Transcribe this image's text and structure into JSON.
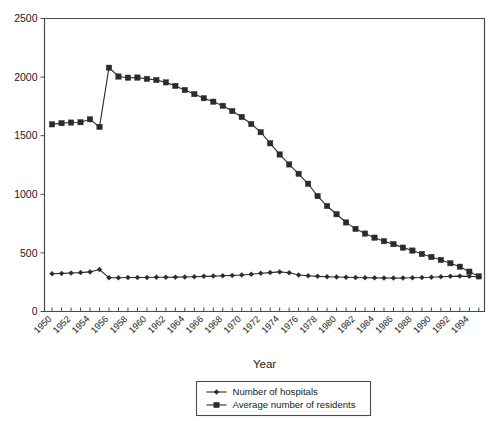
{
  "chart_data": {
    "type": "line",
    "title": "",
    "xlabel": "Year",
    "ylabel": "",
    "xlim": [
      1949.2,
      1995.6
    ],
    "ylim": [
      0,
      2500
    ],
    "grid": false,
    "legend_position": "bottom-center",
    "ytick_labels": [
      "0",
      "500",
      "1000",
      "1500",
      "2000",
      "2500"
    ],
    "yticks": [
      0,
      500,
      1000,
      1500,
      2000,
      2500
    ],
    "xtick_labels": [
      "1950",
      "1952",
      "1954",
      "1956",
      "1958",
      "1960",
      "1962",
      "1964",
      "1966",
      "1968",
      "1970",
      "1972",
      "1974",
      "1976",
      "1978",
      "1980",
      "1982",
      "1984",
      "1986",
      "1988",
      "1990",
      "1992",
      "1994"
    ],
    "xticks_minor": [
      1950,
      1951,
      1952,
      1953,
      1954,
      1955,
      1956,
      1957,
      1958,
      1959,
      1960,
      1961,
      1962,
      1963,
      1964,
      1965,
      1966,
      1967,
      1968,
      1969,
      1970,
      1971,
      1972,
      1973,
      1974,
      1975,
      1976,
      1977,
      1978,
      1979,
      1980,
      1981,
      1982,
      1983,
      1984,
      1985,
      1986,
      1987,
      1988,
      1989,
      1990,
      1991,
      1992,
      1993,
      1994,
      1995
    ],
    "x": [
      1950,
      1951,
      1952,
      1953,
      1954,
      1955,
      1956,
      1957,
      1958,
      1959,
      1960,
      1961,
      1962,
      1963,
      1964,
      1965,
      1966,
      1967,
      1968,
      1969,
      1970,
      1971,
      1972,
      1973,
      1974,
      1975,
      1976,
      1977,
      1978,
      1979,
      1980,
      1981,
      1982,
      1983,
      1984,
      1985,
      1986,
      1987,
      1988,
      1989,
      1990,
      1991,
      1992,
      1993,
      1994,
      1995
    ],
    "series": [
      {
        "name": "Number of hospitals",
        "marker": "diamond",
        "color": "#2b2b2b",
        "values": [
          322,
          325,
          328,
          332,
          338,
          358,
          288,
          288,
          290,
          290,
          290,
          292,
          292,
          293,
          295,
          297,
          300,
          302,
          305,
          308,
          312,
          318,
          326,
          332,
          338,
          330,
          312,
          305,
          300,
          297,
          295,
          292,
          290,
          288,
          287,
          286,
          285,
          286,
          288,
          290,
          292,
          296,
          300,
          302,
          300,
          296
        ]
      },
      {
        "name": "Average number of residents",
        "marker": "square",
        "color": "#2b2b2b",
        "values": [
          1597,
          1607,
          1612,
          1615,
          1640,
          1575,
          2080,
          2005,
          1995,
          1996,
          1985,
          1975,
          1955,
          1925,
          1890,
          1855,
          1820,
          1790,
          1755,
          1710,
          1660,
          1600,
          1530,
          1435,
          1340,
          1255,
          1175,
          1090,
          985,
          900,
          830,
          760,
          705,
          665,
          630,
          600,
          575,
          545,
          520,
          490,
          465,
          440,
          412,
          382,
          340,
          300
        ]
      }
    ]
  },
  "legend": {
    "items": [
      {
        "label": "Number of hospitals",
        "marker": "diamond"
      },
      {
        "label": "Average number of residents",
        "marker": "square"
      }
    ]
  },
  "axis_title_x": "Year"
}
